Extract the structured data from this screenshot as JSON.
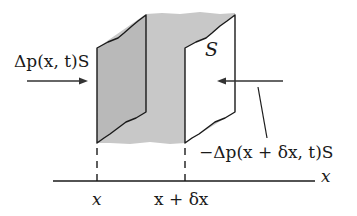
{
  "diagram": {
    "type": "physics-fluid-element",
    "colors": {
      "shading": "#c8c8c8",
      "ink": "#1a1a1a",
      "background": "#ffffff"
    },
    "labels": {
      "left_force": "Δp(x, t)S",
      "right_force": "−Δp(x + δx, t)S",
      "area": "S",
      "axis": "x",
      "tick_x": "x",
      "tick_x_dx": "x + δx"
    }
  }
}
